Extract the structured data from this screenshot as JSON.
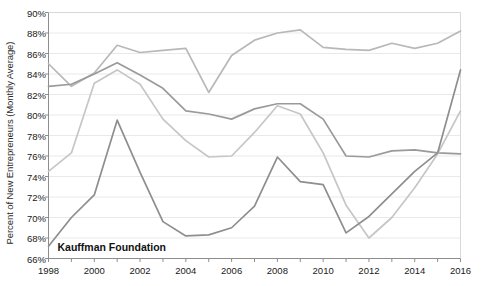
{
  "chart_data": {
    "type": "line",
    "title": "",
    "xlabel": "",
    "ylabel": "Percent of New Entrepreneurs (Monthly Average)",
    "xlim": [
      1998,
      2016
    ],
    "ylim": [
      66,
      90
    ],
    "ytick_suffix": "%",
    "ytick_step": 2,
    "xtick_step": 2,
    "grid": true,
    "grid_axis": "y",
    "legend": "none",
    "x": [
      1998,
      1999,
      2000,
      2001,
      2002,
      2003,
      2004,
      2005,
      2006,
      2007,
      2008,
      2009,
      2010,
      2011,
      2012,
      2013,
      2014,
      2015,
      2016
    ],
    "categories": [
      "1998",
      "1999",
      "2000",
      "2001",
      "2002",
      "2003",
      "2004",
      "2005",
      "2006",
      "2007",
      "2008",
      "2009",
      "2010",
      "2011",
      "2012",
      "2013",
      "2014",
      "2015",
      "2016"
    ],
    "xticklabels": [
      "1998",
      "2000",
      "2002",
      "2004",
      "2006",
      "2008",
      "2010",
      "2012",
      "2014",
      "2016"
    ],
    "yticklabels": [
      "66%",
      "68%",
      "70%",
      "72%",
      "74%",
      "76%",
      "78%",
      "80%",
      "82%",
      "84%",
      "86%",
      "88%",
      "90%"
    ],
    "series": [
      {
        "name": "series-1",
        "color": "#b8b8b8",
        "width": 1.7,
        "values": [
          85.0,
          82.8,
          84.1,
          86.8,
          86.1,
          86.3,
          86.5,
          82.2,
          85.8,
          87.3,
          88.0,
          88.3,
          86.6,
          86.4,
          86.3,
          87.0,
          86.5,
          87.0,
          88.2
        ]
      },
      {
        "name": "series-2",
        "color": "#9a9a9a",
        "width": 1.7,
        "values": [
          82.8,
          83.0,
          84.0,
          85.1,
          83.9,
          82.6,
          80.4,
          80.1,
          79.6,
          80.6,
          81.1,
          81.1,
          79.6,
          76.0,
          75.9,
          76.5,
          76.6,
          76.3,
          76.2
        ]
      },
      {
        "name": "series-3",
        "color": "#c6c6c6",
        "width": 1.7,
        "values": [
          74.5,
          76.3,
          83.1,
          84.4,
          83.0,
          79.6,
          77.5,
          75.9,
          76.0,
          78.3,
          80.9,
          80.1,
          76.3,
          71.2,
          68.0,
          70.0,
          72.9,
          76.2,
          80.4
        ]
      },
      {
        "name": "series-4",
        "color": "#8e8e8e",
        "width": 1.7,
        "values": [
          67.2,
          70.0,
          72.2,
          79.5,
          74.4,
          69.6,
          68.2,
          68.3,
          69.0,
          71.1,
          75.9,
          73.5,
          73.2,
          68.5,
          70.1,
          72.3,
          74.5,
          76.3,
          84.4
        ]
      }
    ],
    "watermark": "Kauffman Foundation"
  }
}
